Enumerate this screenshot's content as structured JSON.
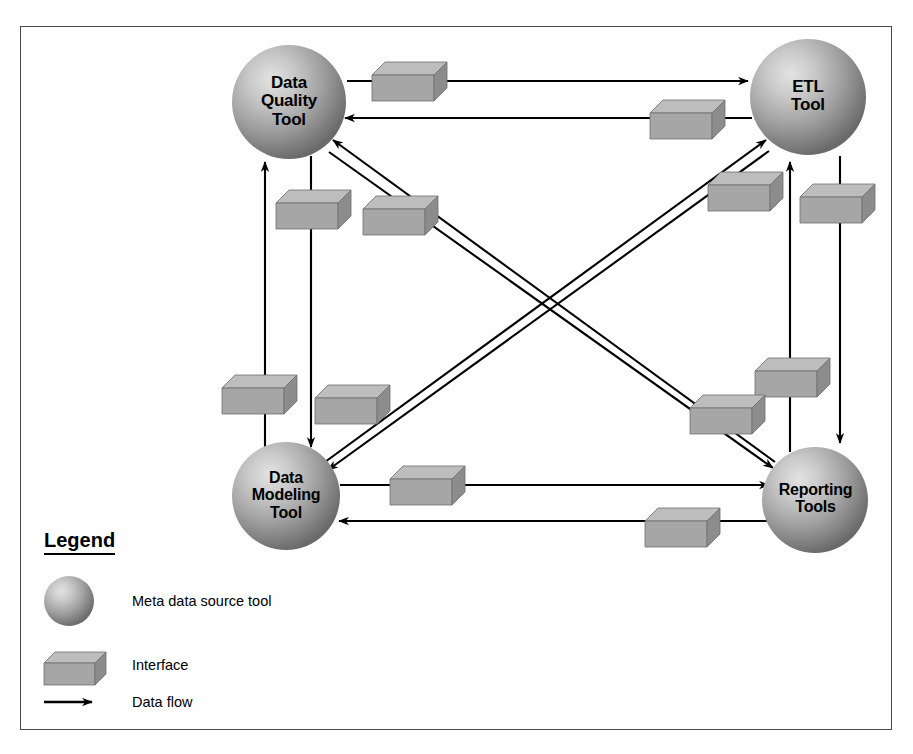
{
  "diagram": {
    "background_color": "#ffffff",
    "frame_color": "#4a4a4a",
    "node_fill_light": "#d8d8d8",
    "node_fill_dark": "#6e6e6e",
    "box_top_color": "#b4b4b4",
    "box_front_color": "#a0a0a0",
    "box_side_color": "#767676",
    "arrow_color": "#000000"
  },
  "nodes": [
    {
      "id": "data-quality-tool",
      "label": "Data\nQuality\nTool",
      "cx": 289,
      "cy": 102,
      "r": 57,
      "font_size": 17
    },
    {
      "id": "etl-tool",
      "label": "ETL\nTool",
      "cx": 808,
      "cy": 97,
      "r": 58,
      "font_size": 17
    },
    {
      "id": "data-modeling-tool",
      "label": "Data\nModeling\nTool",
      "cx": 286,
      "cy": 496,
      "r": 54,
      "font_size": 16
    },
    {
      "id": "reporting-tools",
      "label": "Reporting\nTools",
      "cx": 815,
      "cy": 500,
      "r": 53,
      "font_size": 16
    }
  ],
  "flows": [
    {
      "id": "dq-to-etl",
      "from": "data-quality-tool",
      "to": "etl-tool",
      "kind": "data-flow"
    },
    {
      "id": "etl-to-dq",
      "from": "etl-tool",
      "to": "data-quality-tool",
      "kind": "data-flow"
    },
    {
      "id": "dm-to-dq",
      "from": "data-modeling-tool",
      "to": "data-quality-tool",
      "kind": "data-flow"
    },
    {
      "id": "dq-to-dm",
      "from": "data-quality-tool",
      "to": "data-modeling-tool",
      "kind": "data-flow"
    },
    {
      "id": "rt-to-dq",
      "from": "reporting-tools",
      "to": "data-quality-tool",
      "kind": "data-flow"
    },
    {
      "id": "dq-to-rt",
      "from": "data-quality-tool",
      "to": "reporting-tools",
      "kind": "data-flow"
    },
    {
      "id": "dm-to-etl",
      "from": "data-modeling-tool",
      "to": "etl-tool",
      "kind": "data-flow"
    },
    {
      "id": "etl-to-dm",
      "from": "etl-tool",
      "to": "data-modeling-tool",
      "kind": "data-flow"
    },
    {
      "id": "rt-to-etl",
      "from": "reporting-tools",
      "to": "etl-tool",
      "kind": "data-flow"
    },
    {
      "id": "etl-to-rt",
      "from": "etl-tool",
      "to": "reporting-tools",
      "kind": "data-flow"
    },
    {
      "id": "dm-to-rt",
      "from": "data-modeling-tool",
      "to": "reporting-tools",
      "kind": "data-flow"
    },
    {
      "id": "rt-to-dm",
      "from": "reporting-tools",
      "to": "data-modeling-tool",
      "kind": "data-flow"
    }
  ],
  "interfaces": [
    {
      "id": "iface-dq-etl",
      "on_flow": "dq-to-etl",
      "x": 372,
      "y": 62
    },
    {
      "id": "iface-etl-dq",
      "on_flow": "etl-to-dq",
      "x": 650,
      "y": 100
    },
    {
      "id": "iface-dq-dm",
      "on_flow": "dq-to-dm",
      "x": 276,
      "y": 190
    },
    {
      "id": "iface-dq-rt",
      "on_flow": "dq-to-rt",
      "x": 363,
      "y": 196
    },
    {
      "id": "iface-dm-dq",
      "on_flow": "dm-to-dq",
      "x": 222,
      "y": 375
    },
    {
      "id": "iface-rt-dq",
      "on_flow": "rt-to-dq",
      "x": 315,
      "y": 385
    },
    {
      "id": "iface-dm-etl",
      "on_flow": "dm-to-etl",
      "x": 708,
      "y": 172
    },
    {
      "id": "iface-etl-rt",
      "on_flow": "etl-to-rt",
      "x": 800,
      "y": 184
    },
    {
      "id": "iface-rt-etl",
      "on_flow": "rt-to-etl",
      "x": 755,
      "y": 358
    },
    {
      "id": "iface-etl-dm",
      "on_flow": "etl-to-dm",
      "x": 690,
      "y": 395
    },
    {
      "id": "iface-dm-rt",
      "on_flow": "dm-to-rt",
      "x": 390,
      "y": 466
    },
    {
      "id": "iface-rt-dm",
      "on_flow": "rt-to-dm",
      "x": 645,
      "y": 508
    }
  ],
  "legend": {
    "title": "Legend",
    "items": [
      {
        "id": "legend-node",
        "symbol": "sphere",
        "label": "Meta data source tool"
      },
      {
        "id": "legend-interface",
        "symbol": "cuboid",
        "label": "Interface"
      },
      {
        "id": "legend-dataflow",
        "symbol": "arrow",
        "label": "Data flow"
      }
    ]
  }
}
